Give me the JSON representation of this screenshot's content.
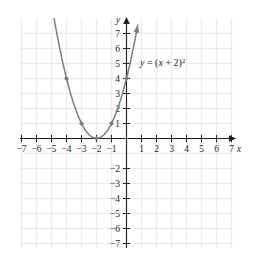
{
  "chart_data": {
    "type": "line",
    "title": "",
    "subtitle": "",
    "xlabel": "x",
    "ylabel": "y",
    "xlim": [
      -7.8,
      7.8
    ],
    "ylim": [
      -7.8,
      7.8
    ],
    "xticks": [
      -7,
      -6,
      -5,
      -4,
      -3,
      -2,
      -1,
      1,
      2,
      3,
      4,
      5,
      6,
      7
    ],
    "yticks": [
      7,
      6,
      5,
      4,
      3,
      2,
      1,
      -2,
      -3,
      -4,
      -5,
      -6,
      -7
    ],
    "xtick_labels": [
      "−7",
      "−6",
      "−5",
      "−4",
      "−3",
      "−2",
      "−1",
      "1",
      "2",
      "3",
      "4",
      "5",
      "6",
      "7"
    ],
    "ytick_labels": [
      "7",
      "6",
      "5",
      "4",
      "3",
      "2",
      "1",
      "−2",
      "−3",
      "−4",
      "−5",
      "−6",
      "−7"
    ],
    "grid": true,
    "grid_color": "#ececed",
    "axis_color": "#221f1f",
    "curve_color": "#7c7b7d",
    "legend": "none",
    "annotations": [
      {
        "name": "equation-label",
        "text": "y = (x + 2)²",
        "text_parts": {
          "lhs": "y",
          "equals": "=",
          "open": "(",
          "var": "x",
          "plus": "+",
          "const": "2",
          "close": ")",
          "exponent": "2"
        },
        "x": 1.0,
        "y": 5.2
      }
    ],
    "series": [
      {
        "name": "y = (x + 2)^2",
        "equation": "y = (x + 2)^2",
        "vertex": [
          -2,
          0
        ],
        "domain": [
          -5.1,
          0.75
        ],
        "arrow_start": [
          -5.1,
          9.6
        ],
        "arrow_end": [
          0.75,
          7.56
        ],
        "marked_points": [
          {
            "x": -4,
            "y": 4
          },
          {
            "x": -3,
            "y": 1
          },
          {
            "x": -2,
            "y": 0
          },
          {
            "x": -1,
            "y": 1
          },
          {
            "x": 0,
            "y": 4
          }
        ],
        "points": [
          {
            "x": -5.1,
            "y": 9.61
          },
          {
            "x": -4.75,
            "y": 7.56
          },
          {
            "x": -4.5,
            "y": 6.25
          },
          {
            "x": -4.25,
            "y": 5.06
          },
          {
            "x": -4.0,
            "y": 4.0
          },
          {
            "x": -3.75,
            "y": 3.06
          },
          {
            "x": -3.5,
            "y": 2.25
          },
          {
            "x": -3.25,
            "y": 1.56
          },
          {
            "x": -3.0,
            "y": 1.0
          },
          {
            "x": -2.75,
            "y": 0.56
          },
          {
            "x": -2.5,
            "y": 0.25
          },
          {
            "x": -2.25,
            "y": 0.06
          },
          {
            "x": -2.0,
            "y": 0.0
          },
          {
            "x": -1.75,
            "y": 0.06
          },
          {
            "x": -1.5,
            "y": 0.25
          },
          {
            "x": -1.25,
            "y": 0.56
          },
          {
            "x": -1.0,
            "y": 1.0
          },
          {
            "x": -0.75,
            "y": 1.56
          },
          {
            "x": -0.5,
            "y": 2.25
          },
          {
            "x": -0.25,
            "y": 3.06
          },
          {
            "x": 0.0,
            "y": 4.0
          },
          {
            "x": 0.25,
            "y": 5.06
          },
          {
            "x": 0.5,
            "y": 6.25
          },
          {
            "x": 0.75,
            "y": 7.56
          }
        ]
      }
    ]
  },
  "axes": {
    "x_axis_label": "x",
    "y_axis_label": "y"
  }
}
